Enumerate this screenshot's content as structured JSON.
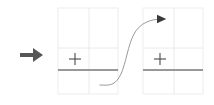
{
  "canvas": {
    "width": 214,
    "height": 105,
    "background": "#ffffff"
  },
  "transition_arrow": {
    "name": "right-arrow-glyph",
    "glyph": "➡",
    "label": "right arrow",
    "color": "#565656",
    "x": 30,
    "y": 54,
    "size": 22
  },
  "colors": {
    "grid_line": "#e8e8e8",
    "grid_border": "#ececec",
    "plus_marker": "#4a4a4a",
    "baseline": "#777777",
    "curve": "#9a9a9a",
    "arrowhead": "#3a3a3a",
    "arrow_glyph": "#565656"
  },
  "panels": [
    {
      "name": "panel-before",
      "label": "before",
      "x": 58,
      "y": 8,
      "width": 60,
      "height": 86,
      "grid": {
        "columns": 2,
        "rows": 2,
        "v_divider_x": 89,
        "h_divider_y": 48,
        "line_color": "#e8e8e8",
        "border_color": "#ececec"
      },
      "plus_marker": {
        "name": "plus-marker",
        "cx": 75,
        "cy": 59,
        "arm": 6,
        "color": "#4a4a4a",
        "stroke_width": 1.1
      },
      "baseline": {
        "name": "baseline-segment",
        "x1": 58,
        "x2": 118,
        "y": 70,
        "color": "#777777",
        "stroke_width": 1.4
      }
    },
    {
      "name": "panel-after",
      "label": "after",
      "x": 143,
      "y": 8,
      "width": 60,
      "height": 86,
      "grid": {
        "columns": 2,
        "rows": 2,
        "v_divider_x": 174,
        "h_divider_y": 48,
        "line_color": "#e8e8e8",
        "border_color": "#ececec"
      },
      "plus_marker": {
        "name": "plus-marker",
        "cx": 160,
        "cy": 59,
        "arm": 6,
        "color": "#4a4a4a",
        "stroke_width": 1.1
      },
      "baseline": {
        "name": "baseline-segment",
        "x1": 143,
        "x2": 203,
        "y": 70,
        "color": "#777777",
        "stroke_width": 1.4
      }
    }
  ],
  "chart_data": {
    "type": "line",
    "title": "",
    "subtitle": "",
    "xlabel": "",
    "ylabel": "",
    "grid": true,
    "legend_position": "none",
    "description": "sigmoid S-curve rising from lower-left baseline to upper-right, terminating in an arrowhead",
    "xlim": [
      100,
      175
    ],
    "ylim": [
      0,
      105
    ],
    "series": [
      {
        "name": "sigmoid-curve",
        "color": "#9a9a9a",
        "stroke_width": 1.0,
        "path": "M 100 85 C 112 86 116 84 121 74 C 126 63 128 45 134 34 C 140 23 150 19 163 19",
        "points": [
          {
            "x": 100,
            "y": 85
          },
          {
            "x": 110,
            "y": 85
          },
          {
            "x": 118,
            "y": 82
          },
          {
            "x": 124,
            "y": 70
          },
          {
            "x": 130,
            "y": 52
          },
          {
            "x": 136,
            "y": 34
          },
          {
            "x": 145,
            "y": 24
          },
          {
            "x": 155,
            "y": 20
          },
          {
            "x": 163,
            "y": 19
          }
        ]
      }
    ],
    "annotations": [
      {
        "name": "curve-arrowhead",
        "type": "arrowhead",
        "x": 163,
        "y": 19,
        "direction": "right",
        "size": 6,
        "color": "#3a3a3a"
      }
    ]
  }
}
